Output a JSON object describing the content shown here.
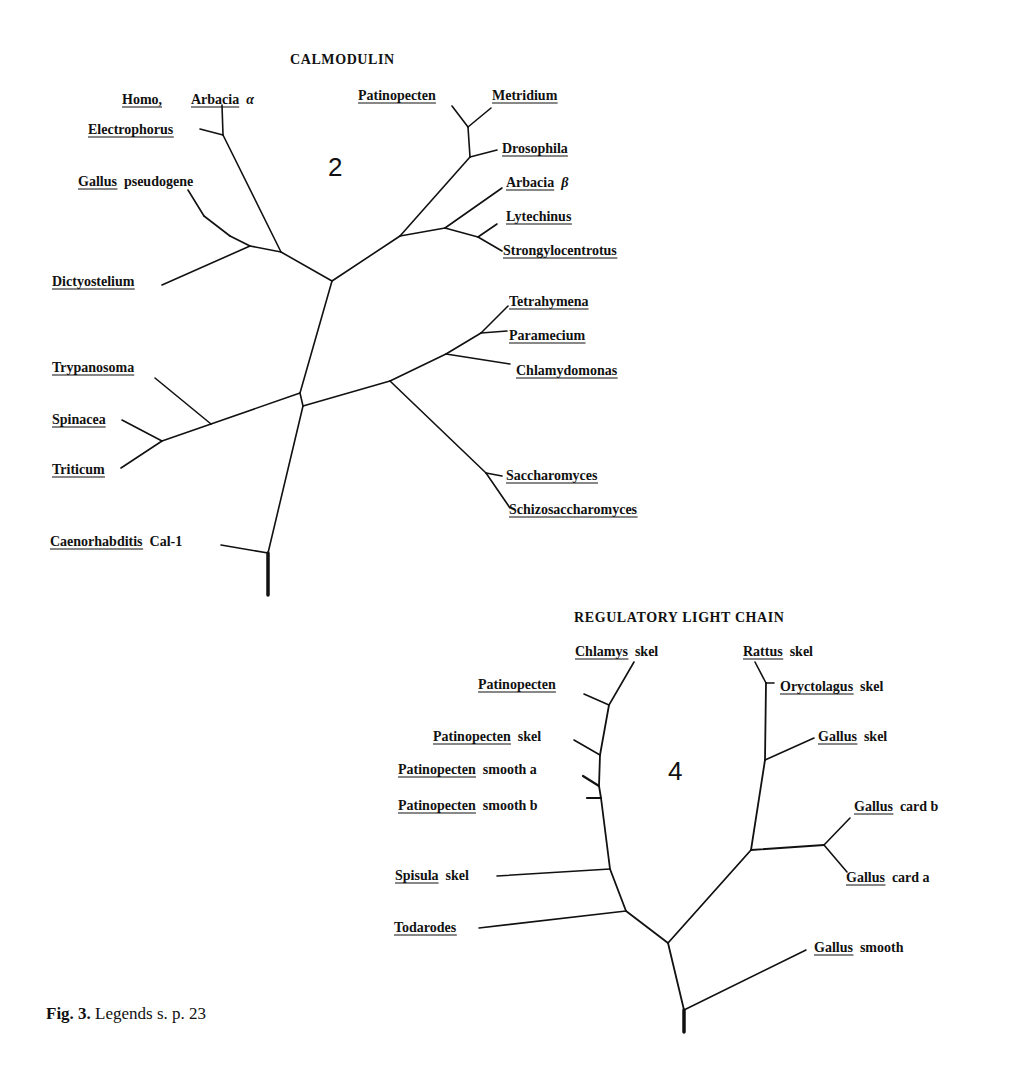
{
  "figure": {
    "caption_bold": "Fig. 3.",
    "caption_text": "Legends s. p. 23"
  },
  "trees": [
    {
      "id": "calmodulin",
      "title": "CALMODULIN",
      "title_pos": [
        290,
        64
      ],
      "panel_number": "2",
      "panel_number_pos": [
        328,
        176
      ],
      "edges": [
        [
          [
            268,
            595
          ],
          [
            268,
            553
          ],
          3.5
        ],
        [
          [
            268,
            553
          ],
          [
            221,
            545
          ],
          1.6
        ],
        [
          [
            268,
            553
          ],
          [
            303,
            406
          ],
          1.6
        ],
        [
          [
            303,
            406
          ],
          [
            300,
            393
          ],
          1.6
        ],
        [
          [
            300,
            393
          ],
          [
            332,
            281
          ],
          1.6
        ],
        [
          [
            300,
            393
          ],
          [
            211,
            424
          ],
          1.6
        ],
        [
          [
            211,
            424
          ],
          [
            155,
            378
          ],
          1.6
        ],
        [
          [
            211,
            424
          ],
          [
            162,
            441
          ],
          1.6
        ],
        [
          [
            162,
            441
          ],
          [
            122,
            420
          ],
          1.6
        ],
        [
          [
            162,
            441
          ],
          [
            121,
            468
          ],
          1.6
        ],
        [
          [
            303,
            406
          ],
          [
            390,
            381
          ],
          1.6
        ],
        [
          [
            390,
            381
          ],
          [
            446,
            354
          ],
          1.6
        ],
        [
          [
            446,
            354
          ],
          [
            510,
            364
          ],
          1.6
        ],
        [
          [
            446,
            354
          ],
          [
            481,
            333
          ],
          1.6
        ],
        [
          [
            481,
            333
          ],
          [
            507,
            331
          ],
          1.6
        ],
        [
          [
            481,
            333
          ],
          [
            508,
            306
          ],
          1.6
        ],
        [
          [
            390,
            381
          ],
          [
            486,
            473
          ],
          1.6
        ],
        [
          [
            486,
            473
          ],
          [
            502,
            476
          ],
          1.6
        ],
        [
          [
            486,
            473
          ],
          [
            510,
            508
          ],
          1.6
        ],
        [
          [
            332,
            281
          ],
          [
            281,
            252
          ],
          1.6
        ],
        [
          [
            281,
            252
          ],
          [
            223,
            135
          ],
          1.6
        ],
        [
          [
            223,
            135
          ],
          [
            222,
            105
          ],
          1.6
        ],
        [
          [
            223,
            135
          ],
          [
            200,
            129
          ],
          1.6
        ],
        [
          [
            281,
            252
          ],
          [
            250,
            246
          ],
          1.6
        ],
        [
          [
            250,
            246
          ],
          [
            162,
            285
          ],
          1.6
        ],
        [
          [
            250,
            246
          ],
          [
            230,
            236
          ],
          1.6
        ],
        [
          [
            230,
            236
          ],
          [
            204,
            216
          ],
          1.6
        ],
        [
          [
            204,
            216
          ],
          [
            188,
            190
          ],
          1.6
        ],
        [
          [
            332,
            281
          ],
          [
            400,
            236
          ],
          1.6
        ],
        [
          [
            400,
            236
          ],
          [
            470,
            157
          ],
          1.6
        ],
        [
          [
            470,
            157
          ],
          [
            468,
            127
          ],
          1.6
        ],
        [
          [
            468,
            127
          ],
          [
            452,
            106
          ],
          1.6
        ],
        [
          [
            468,
            127
          ],
          [
            491,
            108
          ],
          1.6
        ],
        [
          [
            470,
            157
          ],
          [
            497,
            150
          ],
          1.6
        ],
        [
          [
            400,
            236
          ],
          [
            445,
            228
          ],
          1.6
        ],
        [
          [
            445,
            228
          ],
          [
            502,
            188
          ],
          1.6
        ],
        [
          [
            445,
            228
          ],
          [
            478,
            237
          ],
          1.6
        ],
        [
          [
            478,
            237
          ],
          [
            497,
            224
          ],
          1.6
        ],
        [
          [
            478,
            237
          ],
          [
            502,
            251
          ],
          1.6
        ]
      ],
      "labels": [
        {
          "genus": "Homo,",
          "suffix": "",
          "x": 122,
          "y": 104,
          "anchor": "start"
        },
        {
          "genus": "Arbacia",
          "suffix": "α",
          "suffix_italic": true,
          "x": 191,
          "y": 104,
          "anchor": "start"
        },
        {
          "genus": "Electrophorus",
          "suffix": "",
          "x": 88,
          "y": 134,
          "anchor": "start"
        },
        {
          "genus": "Gallus",
          "suffix": "pseudogene",
          "x": 78,
          "y": 186,
          "anchor": "start"
        },
        {
          "genus": "Dictyostelium",
          "suffix": "",
          "x": 52,
          "y": 286,
          "anchor": "start"
        },
        {
          "genus": "Trypanosoma",
          "suffix": "",
          "x": 52,
          "y": 372,
          "anchor": "start"
        },
        {
          "genus": "Spinacea",
          "suffix": "",
          "x": 52,
          "y": 424,
          "anchor": "start"
        },
        {
          "genus": "Triticum",
          "suffix": "",
          "x": 52,
          "y": 474,
          "anchor": "start"
        },
        {
          "genus": "Caenorhabditis",
          "suffix": "Cal-1",
          "x": 50,
          "y": 546,
          "anchor": "start"
        },
        {
          "genus": "Patinopecten",
          "suffix": "",
          "x": 358,
          "y": 100,
          "anchor": "start"
        },
        {
          "genus": "Metridium",
          "suffix": "",
          "x": 492,
          "y": 100,
          "anchor": "start"
        },
        {
          "genus": "Drosophila",
          "suffix": "",
          "x": 502,
          "y": 153,
          "anchor": "start"
        },
        {
          "genus": "Arbacia",
          "suffix": "β",
          "suffix_italic": true,
          "x": 506,
          "y": 187,
          "anchor": "start"
        },
        {
          "genus": "Lytechinus",
          "suffix": "",
          "x": 506,
          "y": 221,
          "anchor": "start"
        },
        {
          "genus": "Strongylocentrotus",
          "suffix": "",
          "x": 503,
          "y": 255,
          "anchor": "start"
        },
        {
          "genus": "Tetrahymena",
          "suffix": "",
          "x": 509,
          "y": 306,
          "anchor": "start"
        },
        {
          "genus": "Paramecium",
          "suffix": "",
          "x": 509,
          "y": 340,
          "anchor": "start"
        },
        {
          "genus": "Chlamydomonas",
          "suffix": "",
          "x": 516,
          "y": 375,
          "anchor": "start"
        },
        {
          "genus": "Saccharomyces",
          "suffix": "",
          "x": 506,
          "y": 480,
          "anchor": "start"
        },
        {
          "genus": "Schizosaccharomyces",
          "suffix": "",
          "x": 509,
          "y": 514,
          "anchor": "start"
        }
      ]
    },
    {
      "id": "regulatory-light-chain",
      "title": "REGULATORY LIGHT CHAIN",
      "title_pos": [
        574,
        622
      ],
      "panel_number": "4",
      "panel_number_pos": [
        668,
        780
      ],
      "edges": [
        [
          [
            684,
            1032
          ],
          [
            684,
            1010
          ],
          3.5
        ],
        [
          [
            684,
            1010
          ],
          [
            668,
            943
          ],
          1.8
        ],
        [
          [
            684,
            1010
          ],
          [
            806,
            950
          ],
          1.6
        ],
        [
          [
            668,
            943
          ],
          [
            626,
            911
          ],
          1.8
        ],
        [
          [
            626,
            911
          ],
          [
            479,
            928
          ],
          1.6
        ],
        [
          [
            626,
            911
          ],
          [
            610,
            869
          ],
          1.8
        ],
        [
          [
            610,
            869
          ],
          [
            497,
            876
          ],
          1.6
        ],
        [
          [
            610,
            869
          ],
          [
            601,
            798
          ],
          1.8
        ],
        [
          [
            601,
            798
          ],
          [
            587,
            798
          ],
          2.2
        ],
        [
          [
            601,
            798
          ],
          [
            599,
            786
          ],
          1.8
        ],
        [
          [
            599,
            786
          ],
          [
            583,
            776
          ],
          2.2
        ],
        [
          [
            599,
            786
          ],
          [
            600,
            755
          ],
          1.8
        ],
        [
          [
            600,
            755
          ],
          [
            574,
            740
          ],
          1.6
        ],
        [
          [
            600,
            755
          ],
          [
            609,
            705
          ],
          1.8
        ],
        [
          [
            609,
            705
          ],
          [
            584,
            694
          ],
          1.6
        ],
        [
          [
            609,
            705
          ],
          [
            634,
            662
          ],
          1.6
        ],
        [
          [
            668,
            943
          ],
          [
            751,
            850
          ],
          1.8
        ],
        [
          [
            751,
            850
          ],
          [
            824,
            845
          ],
          1.8
        ],
        [
          [
            824,
            845
          ],
          [
            850,
            818
          ],
          1.6
        ],
        [
          [
            824,
            845
          ],
          [
            847,
            872
          ],
          1.6
        ],
        [
          [
            751,
            850
          ],
          [
            765,
            760
          ],
          1.8
        ],
        [
          [
            765,
            760
          ],
          [
            814,
            738
          ],
          1.6
        ],
        [
          [
            765,
            760
          ],
          [
            766,
            683
          ],
          1.8
        ],
        [
          [
            766,
            683
          ],
          [
            774,
            683
          ],
          1.6
        ],
        [
          [
            766,
            683
          ],
          [
            755,
            662
          ],
          1.6
        ]
      ],
      "labels": [
        {
          "genus": "Chlamys",
          "suffix": "skel",
          "x": 575,
          "y": 656,
          "anchor": "start"
        },
        {
          "genus": "Patinopecten",
          "suffix": "",
          "x": 478,
          "y": 689,
          "anchor": "start"
        },
        {
          "genus": "Patinopecten",
          "suffix": "skel",
          "x": 433,
          "y": 741,
          "anchor": "start"
        },
        {
          "genus": "Patinopecten",
          "suffix": "smooth a",
          "x": 398,
          "y": 774,
          "anchor": "start"
        },
        {
          "genus": "Patinopecten",
          "suffix": "smooth b",
          "x": 398,
          "y": 810,
          "anchor": "start"
        },
        {
          "genus": "Spisula",
          "suffix": "skel",
          "x": 395,
          "y": 880,
          "anchor": "start"
        },
        {
          "genus": "Todarodes",
          "suffix": "",
          "x": 394,
          "y": 932,
          "anchor": "start"
        },
        {
          "genus": "Rattus",
          "suffix": "skel",
          "x": 743,
          "y": 656,
          "anchor": "start"
        },
        {
          "genus": "Oryctolagus",
          "suffix": "skel",
          "x": 780,
          "y": 691,
          "anchor": "start"
        },
        {
          "genus": "Gallus",
          "suffix": "skel",
          "x": 818,
          "y": 741,
          "anchor": "start"
        },
        {
          "genus": "Gallus",
          "suffix": "card b",
          "x": 854,
          "y": 811,
          "anchor": "start"
        },
        {
          "genus": "Gallus",
          "suffix": "card a",
          "x": 846,
          "y": 882,
          "anchor": "start"
        },
        {
          "genus": "Gallus",
          "suffix": "smooth",
          "x": 814,
          "y": 952,
          "anchor": "start"
        }
      ]
    }
  ]
}
